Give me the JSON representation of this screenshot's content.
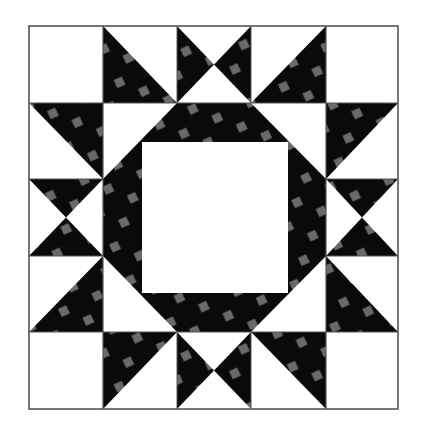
{
  "figure": {
    "background": "#ffffff",
    "frame": {
      "x": 29,
      "y": 26,
      "width": 369,
      "height": 383,
      "stroke": "#555555"
    },
    "grid": {
      "cols": [
        29,
        103,
        177,
        251,
        326,
        398
      ],
      "rows": [
        26,
        103,
        179,
        256,
        332,
        409
      ]
    },
    "colors": {
      "light_fabric": "#ffffff",
      "dark_fabric": "#0a0a0a",
      "dot_print": "#6a6a6a",
      "seam": "#555555"
    },
    "center_square": {
      "x": 142,
      "y": 142,
      "width": 146,
      "height": 151
    },
    "ring_octagon": [
      [
        177,
        103
      ],
      [
        251,
        103
      ],
      [
        326,
        179
      ],
      [
        326,
        256
      ],
      [
        251,
        332
      ],
      [
        177,
        332
      ],
      [
        103,
        256
      ],
      [
        103,
        179
      ]
    ],
    "pieces": [
      {
        "name": "top-left-star-point",
        "cell": [
          0,
          1
        ],
        "dark": "lower-left"
      },
      {
        "name": "top-hourglass",
        "cell": [
          0,
          2
        ],
        "dark": "left-right"
      },
      {
        "name": "top-right-star-point",
        "cell": [
          0,
          3
        ],
        "dark": "lower-right"
      },
      {
        "name": "left-upper-star-point",
        "cell": [
          1,
          0
        ],
        "dark": "upper-right"
      },
      {
        "name": "left-hourglass",
        "cell": [
          2,
          0
        ],
        "dark": "top-bottom"
      },
      {
        "name": "left-lower-star-point",
        "cell": [
          3,
          0
        ],
        "dark": "lower-right"
      },
      {
        "name": "right-upper-star-point",
        "cell": [
          1,
          4
        ],
        "dark": "upper-left"
      },
      {
        "name": "right-hourglass",
        "cell": [
          2,
          4
        ],
        "dark": "top-bottom"
      },
      {
        "name": "right-lower-star-point",
        "cell": [
          3,
          4
        ],
        "dark": "lower-left"
      },
      {
        "name": "bottom-left-star-point",
        "cell": [
          4,
          1
        ],
        "dark": "upper-left"
      },
      {
        "name": "bottom-hourglass",
        "cell": [
          4,
          2
        ],
        "dark": "left-right"
      },
      {
        "name": "bottom-right-star-point",
        "cell": [
          4,
          3
        ],
        "dark": "upper-right"
      }
    ],
    "corner_squares": [
      [
        0,
        0
      ],
      [
        0,
        4
      ],
      [
        4,
        0
      ],
      [
        4,
        4
      ]
    ]
  }
}
